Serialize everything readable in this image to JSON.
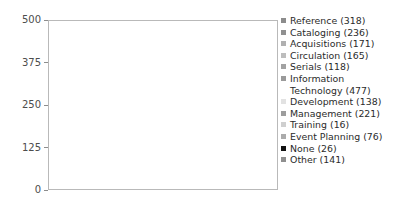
{
  "chart_data": {
    "type": "bar",
    "title": "",
    "xlabel": "",
    "ylabel": "",
    "ylim": [
      0,
      500
    ],
    "yticks": [
      "0",
      "125",
      "250",
      "375",
      "500"
    ],
    "ytick_values": [
      0,
      125,
      250,
      375,
      500
    ],
    "grid": false,
    "legend_position": "right",
    "categories": [
      "Reference",
      "Cataloging",
      "Acquisitions",
      "Circulation",
      "Serials",
      "Information Technology",
      "Development",
      "Management",
      "Training",
      "Event Planning",
      "None",
      "Other"
    ],
    "values": [
      318,
      236,
      171,
      165,
      118,
      477,
      138,
      221,
      16,
      76,
      26,
      141
    ],
    "colors": [
      "#8c8c8c",
      "#909090",
      "#b0b0b0",
      "#bdbdbd",
      "#a2a2a2",
      "#9a9a9a",
      "#e2e2e2",
      "#9d9d9d",
      "#cfcfcf",
      "#ababab",
      "#111111",
      "#8f8f8f"
    ]
  },
  "legend": {
    "items": [
      {
        "label": "Reference (318)",
        "color": "#8c8c8c"
      },
      {
        "label": "Cataloging (236)",
        "color": "#909090"
      },
      {
        "label": "Acquisitions (171)",
        "color": "#b0b0b0"
      },
      {
        "label": "Circulation (165)",
        "color": "#bdbdbd"
      },
      {
        "label": "Serials (118)",
        "color": "#a2a2a2"
      },
      {
        "label": "Information Technology (477)",
        "color": "#9a9a9a"
      },
      {
        "label": "Development (138)",
        "color": "#e2e2e2"
      },
      {
        "label": "Management (221)",
        "color": "#9d9d9d"
      },
      {
        "label": "Training (16)",
        "color": "#cfcfcf"
      },
      {
        "label": "Event Planning (76)",
        "color": "#ababab"
      },
      {
        "label": "None (26)",
        "color": "#111111"
      },
      {
        "label": "Other (141)",
        "color": "#8f8f8f"
      }
    ]
  },
  "axis": {
    "tick_500": "500",
    "tick_375": "375",
    "tick_250": "250",
    "tick_125": "125",
    "tick_0": "0"
  }
}
